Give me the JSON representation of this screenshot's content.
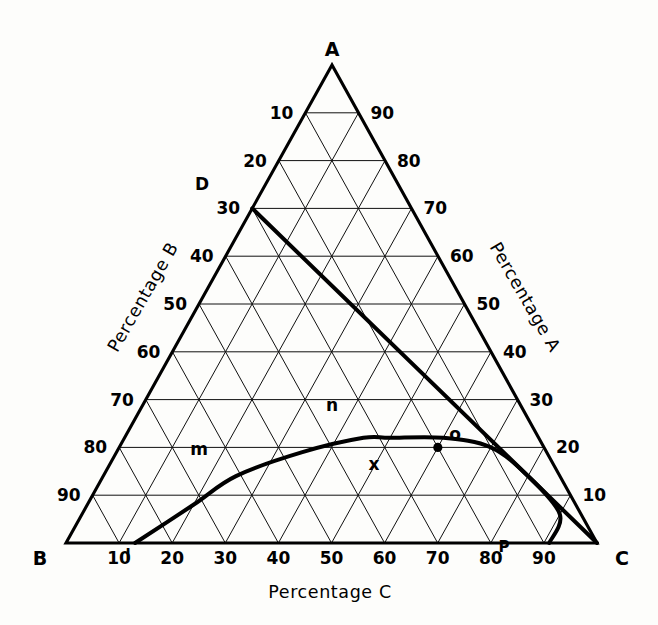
{
  "figure": {
    "type": "ternary-phase-diagram",
    "background_color": "#fdfdfb",
    "line_color": "#000000"
  },
  "vertices": {
    "top": "A",
    "bottom_left": "B",
    "bottom_right": "C"
  },
  "axis_titles": {
    "left": "Percentage B",
    "right": "Percentage A",
    "bottom": "Percentage C"
  },
  "ticks": {
    "left_axis_labels": [
      "10",
      "20",
      "30",
      "40",
      "50",
      "60",
      "70",
      "80",
      "90"
    ],
    "right_axis_labels": [
      "90",
      "80",
      "70",
      "60",
      "50",
      "40",
      "30",
      "20",
      "10"
    ],
    "bottom_axis_labels": [
      "10",
      "20",
      "30",
      "40",
      "50",
      "60",
      "70",
      "80",
      "90"
    ],
    "interval": 10
  },
  "annotations": {
    "D": "D",
    "P": "P",
    "l": "l",
    "m": "m",
    "n": "n",
    "o": "o",
    "x": "x"
  },
  "chart_data": {
    "type": "scatter",
    "title": "",
    "xlabel": "Percentage C",
    "ylabel": "Percentage B",
    "zlabel": "Percentage A",
    "axis_ranges": {
      "A": [
        0,
        100
      ],
      "B": [
        0,
        100
      ],
      "C": [
        0,
        100
      ]
    },
    "grid": true,
    "grid_interval": 10,
    "legend": "none",
    "components": [
      "A",
      "B",
      "C"
    ],
    "points": [
      {
        "label": "D",
        "A": 70,
        "B": 30,
        "C": 0
      },
      {
        "label": "l",
        "A": 0,
        "B": 87,
        "C": 13
      },
      {
        "label": "m",
        "A": 0,
        "B": 80,
        "C": 25,
        "note": "curve crosses B=80 line"
      },
      {
        "label": "n",
        "A": 22,
        "B": 28,
        "C": 50,
        "note": "apex of solubility curve"
      },
      {
        "label": "o",
        "A": 20,
        "B": 10,
        "C": 70
      },
      {
        "label": "x",
        "A": 20,
        "B": 20,
        "C": 60,
        "marker": "filled-dot"
      },
      {
        "label": "P",
        "A": 0,
        "B": 9,
        "C": 91
      }
    ],
    "curves": [
      {
        "name": "solubility-curve",
        "style": "thick-solid",
        "through": [
          "l",
          "m",
          "n",
          "o",
          "P"
        ],
        "points": [
          {
            "A": 0,
            "B": 87,
            "C": 13
          },
          {
            "A": 8,
            "B": 72,
            "C": 20
          },
          {
            "A": 14,
            "B": 61,
            "C": 25
          },
          {
            "A": 19,
            "B": 46,
            "C": 35
          },
          {
            "A": 22,
            "B": 33,
            "C": 45
          },
          {
            "A": 22,
            "B": 28,
            "C": 50
          },
          {
            "A": 22,
            "B": 18,
            "C": 60
          },
          {
            "A": 20,
            "B": 10,
            "C": 70
          },
          {
            "A": 14,
            "B": 6,
            "C": 80
          },
          {
            "A": 6,
            "B": 4,
            "C": 90
          },
          {
            "A": 0,
            "B": 9,
            "C": 91
          }
        ]
      },
      {
        "name": "tie-line-D-to-C",
        "style": "thick-straight",
        "from": {
          "label": "D",
          "A": 70,
          "B": 30,
          "C": 0
        },
        "to": {
          "label": "C",
          "A": 0,
          "B": 0,
          "C": 100
        }
      }
    ]
  }
}
